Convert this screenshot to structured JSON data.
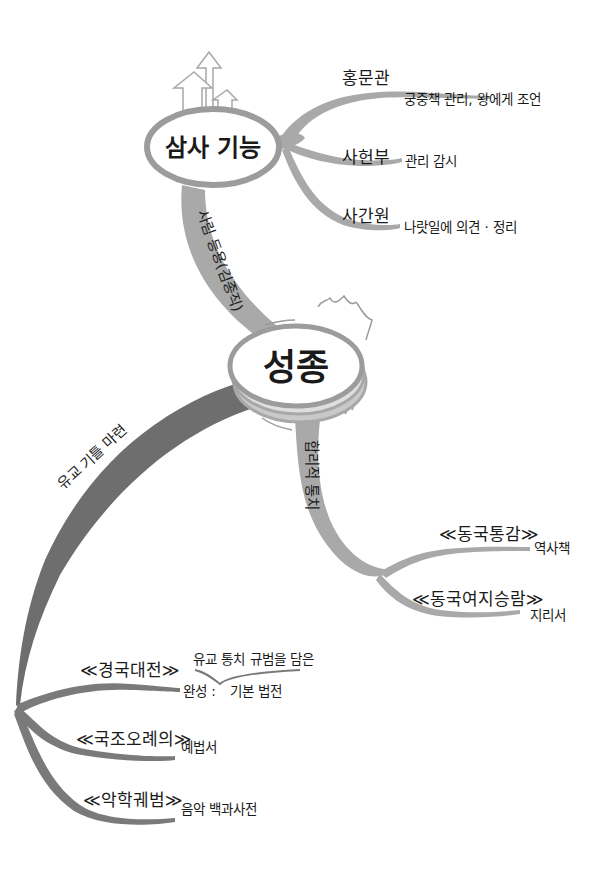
{
  "diagram": {
    "type": "mindmap",
    "colors": {
      "background": "#ffffff",
      "branch_light": "#a9a9a9",
      "branch_dark": "#6e6e6e",
      "node_outline": "#9c9c9c",
      "text": "#1a1a1a"
    },
    "center": {
      "label": "성종"
    },
    "nodes": {
      "samsa": {
        "label": "삼사 기능",
        "edge_label": "사림 등용(김종직)",
        "children": [
          {
            "title": "홍문관",
            "desc": "궁중책 관리, 왕에게 조언"
          },
          {
            "title": "사헌부",
            "desc": "관리 감시"
          },
          {
            "title": "사간원",
            "desc": "나랏일에 의견 · 정리"
          }
        ]
      },
      "rational": {
        "edge_label": "합리적 통치",
        "children": [
          {
            "title": "≪동국통감≫",
            "desc": "역사책"
          },
          {
            "title": "≪동국여지승람≫",
            "desc": "지리서"
          }
        ]
      },
      "confucian": {
        "edge_label": "유교 기틀 마련",
        "children": [
          {
            "title": "≪경국대전≫",
            "desc_prefix": "완성 :",
            "desc_top": "유교 통치 규범을 담은",
            "desc_bottom": "기본 법전"
          },
          {
            "title": "≪국조오례의≫",
            "desc": "예법서"
          },
          {
            "title": "≪악학궤범≫",
            "desc": "음악 백과사전"
          }
        ]
      }
    }
  }
}
